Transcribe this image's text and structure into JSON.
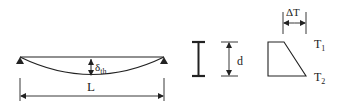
{
  "diagram": {
    "beam": {
      "span_label": "L",
      "deflection_label": "δ",
      "deflection_subscript": "th"
    },
    "section": {
      "depth_label": "d"
    },
    "temperature_gradient": {
      "delta_label": "ΔT",
      "top_label": "T",
      "top_subscript": "1",
      "bottom_label": "T",
      "bottom_subscript": "2"
    },
    "colors": {
      "stroke": "#222222",
      "background": "#ffffff"
    }
  }
}
